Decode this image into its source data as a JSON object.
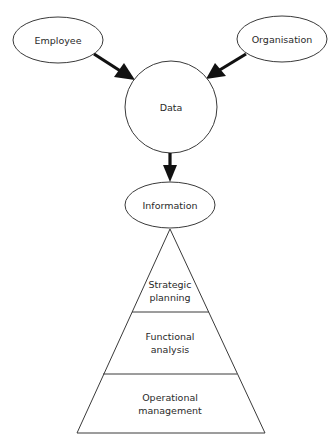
{
  "diagram": {
    "type": "flow-to-pyramid",
    "colors": {
      "stroke": "#3a3a3a",
      "arrow": "#111111",
      "text": "#2a2a2a",
      "background": "#ffffff"
    },
    "nodes": {
      "employee": {
        "label": "Employee",
        "shape": "ellipse"
      },
      "organisation": {
        "label": "Organisation",
        "shape": "ellipse"
      },
      "data": {
        "label": "Data",
        "shape": "circle"
      },
      "information": {
        "label": "Information",
        "shape": "ellipse"
      }
    },
    "edges": [
      {
        "from": "Employee",
        "to": "Data"
      },
      {
        "from": "Organisation",
        "to": "Data"
      },
      {
        "from": "Data",
        "to": "Information"
      }
    ],
    "pyramid": {
      "levels": [
        {
          "line1": "Strategic",
          "line2": "planning"
        },
        {
          "line1": "Functional",
          "line2": "analysis"
        },
        {
          "line1": "Operational",
          "line2": "management"
        }
      ]
    }
  }
}
